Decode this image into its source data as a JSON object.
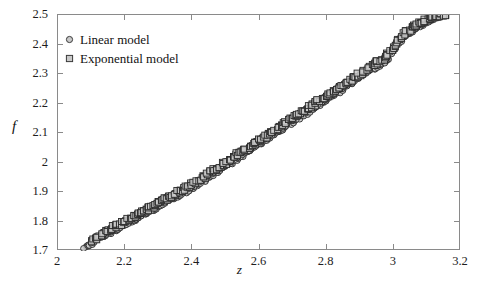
{
  "chart_data": {
    "type": "scatter",
    "title": "",
    "xlabel": "z",
    "ylabel": "f",
    "xlim": [
      2,
      3.2
    ],
    "ylim": [
      1.7,
      2.5
    ],
    "xticks": [
      "2",
      "2.2",
      "2.4",
      "2.6",
      "2.8",
      "3",
      "3.2"
    ],
    "xtick_values": [
      2,
      2.2,
      2.4,
      2.6,
      2.8,
      3.0,
      3.2
    ],
    "yticks": [
      "1.7",
      "1.8",
      "1.9",
      "2",
      "2.1",
      "2.2",
      "2.3",
      "2.4",
      "2.5"
    ],
    "ytick_values": [
      1.7,
      1.8,
      1.9,
      2.0,
      2.1,
      2.2,
      2.3,
      2.4,
      2.5
    ],
    "grid": false,
    "legend_position": "upper-left",
    "marker_fill": "#c9c9c9",
    "marker_edge": "#2a2a2a",
    "frame_color": "#8a8a8a",
    "series": [
      {
        "name": "Linear model",
        "marker": "circle",
        "x": [
          2.082,
          2.09,
          2.098,
          2.106,
          2.114,
          2.122,
          2.13,
          2.138,
          2.146,
          2.154,
          2.162,
          2.17,
          2.178,
          2.186,
          2.194,
          2.202,
          2.21,
          2.218,
          2.226,
          2.234,
          2.242,
          2.25,
          2.258,
          2.266,
          2.274,
          2.282,
          2.29,
          2.298,
          2.306,
          2.314,
          2.322,
          2.33,
          2.338,
          2.346,
          2.354,
          2.362,
          2.37,
          2.378,
          2.386,
          2.394,
          2.402,
          2.41,
          2.418,
          2.426,
          2.434,
          2.442,
          2.45,
          2.458,
          2.466,
          2.474,
          2.482,
          2.49,
          2.498,
          2.506,
          2.514,
          2.522,
          2.53,
          2.538,
          2.546,
          2.554,
          2.562,
          2.57,
          2.578,
          2.586,
          2.594,
          2.602,
          2.61,
          2.618,
          2.626,
          2.634,
          2.642,
          2.65,
          2.658,
          2.666,
          2.674,
          2.682,
          2.69,
          2.698,
          2.706,
          2.714,
          2.722,
          2.73,
          2.738,
          2.746,
          2.754,
          2.762,
          2.77,
          2.778,
          2.786,
          2.794,
          2.802,
          2.81,
          2.818,
          2.826,
          2.834,
          2.842,
          2.85,
          2.858,
          2.866,
          2.874,
          2.882,
          2.89,
          2.898,
          2.906,
          2.914,
          2.922,
          2.93,
          2.938,
          2.946,
          2.954,
          2.962,
          2.97,
          2.978,
          2.986,
          2.994,
          3.002,
          3.01,
          3.018,
          3.026,
          3.034,
          3.042,
          3.05,
          3.058,
          3.066,
          3.074,
          3.082,
          3.09,
          3.098,
          3.106,
          3.114,
          3.122,
          3.13,
          3.138,
          3.146
        ],
        "y": [
          1.712,
          1.718,
          1.724,
          1.73,
          1.736,
          1.742,
          1.747,
          1.752,
          1.757,
          1.762,
          1.767,
          1.772,
          1.777,
          1.782,
          1.787,
          1.792,
          1.797,
          1.802,
          1.807,
          1.812,
          1.817,
          1.822,
          1.827,
          1.832,
          1.837,
          1.842,
          1.847,
          1.852,
          1.857,
          1.862,
          1.867,
          1.872,
          1.877,
          1.882,
          1.887,
          1.892,
          1.897,
          1.902,
          1.907,
          1.912,
          1.917,
          1.922,
          1.928,
          1.934,
          1.94,
          1.946,
          1.952,
          1.958,
          1.964,
          1.97,
          1.976,
          1.982,
          1.988,
          1.994,
          2.0,
          2.006,
          2.012,
          2.018,
          2.024,
          2.03,
          2.036,
          2.042,
          2.048,
          2.054,
          2.06,
          2.066,
          2.072,
          2.078,
          2.084,
          2.09,
          2.096,
          2.102,
          2.108,
          2.114,
          2.12,
          2.126,
          2.132,
          2.138,
          2.144,
          2.15,
          2.156,
          2.162,
          2.168,
          2.174,
          2.18,
          2.186,
          2.192,
          2.198,
          2.204,
          2.21,
          2.216,
          2.222,
          2.228,
          2.234,
          2.24,
          2.246,
          2.252,
          2.258,
          2.264,
          2.27,
          2.276,
          2.282,
          2.288,
          2.294,
          2.3,
          2.306,
          2.312,
          2.318,
          2.324,
          2.33,
          2.336,
          2.342,
          2.35,
          2.36,
          2.372,
          2.386,
          2.4,
          2.412,
          2.422,
          2.43,
          2.437,
          2.443,
          2.449,
          2.455,
          2.461,
          2.467,
          2.472,
          2.477,
          2.482,
          2.487,
          2.491,
          2.494,
          2.497,
          2.5
        ]
      },
      {
        "name": "Exponential model",
        "marker": "square",
        "x": [
          2.104,
          2.112,
          2.12,
          2.128,
          2.136,
          2.144,
          2.152,
          2.16,
          2.168,
          2.176,
          2.184,
          2.192,
          2.2,
          2.208,
          2.216,
          2.224,
          2.232,
          2.24,
          2.248,
          2.256,
          2.264,
          2.272,
          2.28,
          2.288,
          2.296,
          2.304,
          2.312,
          2.32,
          2.328,
          2.336,
          2.344,
          2.352,
          2.36,
          2.368,
          2.376,
          2.384,
          2.392,
          2.4,
          2.408,
          2.416,
          2.424,
          2.432,
          2.44,
          2.448,
          2.456,
          2.464,
          2.472,
          2.48,
          2.488,
          2.496,
          2.504,
          2.512,
          2.52,
          2.528,
          2.536,
          2.544,
          2.552,
          2.56,
          2.568,
          2.576,
          2.584,
          2.592,
          2.6,
          2.608,
          2.616,
          2.624,
          2.632,
          2.64,
          2.648,
          2.656,
          2.664,
          2.672,
          2.68,
          2.688,
          2.696,
          2.704,
          2.712,
          2.72,
          2.728,
          2.736,
          2.744,
          2.752,
          2.76,
          2.768,
          2.776,
          2.784,
          2.792,
          2.8,
          2.808,
          2.816,
          2.824,
          2.832,
          2.84,
          2.848,
          2.856,
          2.864,
          2.872,
          2.88,
          2.888,
          2.896,
          2.904,
          2.912,
          2.92,
          2.928,
          2.936,
          2.944,
          2.952,
          2.96,
          2.968,
          2.976,
          2.984,
          2.992,
          3.0,
          3.008,
          3.016,
          3.024,
          3.032,
          3.04,
          3.048,
          3.056,
          3.064,
          3.072,
          3.08,
          3.088,
          3.096,
          3.104,
          3.112,
          3.12,
          3.128,
          3.136,
          3.144,
          3.15
        ],
        "y": [
          1.736,
          1.742,
          1.748,
          1.754,
          1.76,
          1.766,
          1.771,
          1.776,
          1.781,
          1.786,
          1.791,
          1.796,
          1.801,
          1.806,
          1.811,
          1.816,
          1.821,
          1.826,
          1.831,
          1.836,
          1.841,
          1.846,
          1.851,
          1.856,
          1.861,
          1.866,
          1.871,
          1.876,
          1.881,
          1.886,
          1.891,
          1.896,
          1.901,
          1.906,
          1.911,
          1.916,
          1.921,
          1.926,
          1.932,
          1.938,
          1.944,
          1.95,
          1.956,
          1.962,
          1.968,
          1.974,
          1.98,
          1.986,
          1.992,
          1.998,
          2.004,
          2.01,
          2.016,
          2.022,
          2.028,
          2.034,
          2.04,
          2.046,
          2.052,
          2.058,
          2.064,
          2.07,
          2.076,
          2.082,
          2.088,
          2.094,
          2.1,
          2.106,
          2.112,
          2.118,
          2.124,
          2.13,
          2.136,
          2.142,
          2.148,
          2.154,
          2.16,
          2.166,
          2.172,
          2.178,
          2.184,
          2.19,
          2.196,
          2.202,
          2.208,
          2.214,
          2.22,
          2.226,
          2.232,
          2.238,
          2.244,
          2.25,
          2.256,
          2.262,
          2.268,
          2.274,
          2.28,
          2.286,
          2.292,
          2.298,
          2.304,
          2.31,
          2.316,
          2.322,
          2.328,
          2.334,
          2.34,
          2.346,
          2.352,
          2.358,
          2.366,
          2.376,
          2.388,
          2.402,
          2.415,
          2.426,
          2.435,
          2.443,
          2.45,
          2.456,
          2.462,
          2.468,
          2.473,
          2.478,
          2.483,
          2.487,
          2.491,
          2.494,
          2.497,
          2.499,
          2.5,
          2.5
        ]
      }
    ]
  }
}
